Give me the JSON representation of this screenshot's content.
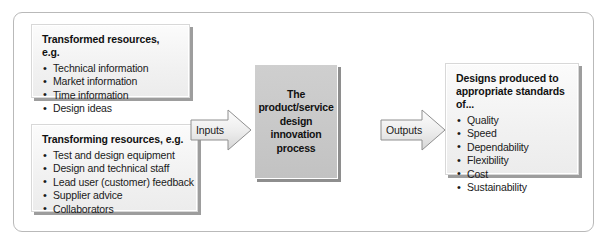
{
  "diagram": {
    "frame": {
      "border_color": "#b9b9b9",
      "background": "#ffffff"
    }
  },
  "boxes": {
    "transformed_resources": {
      "title": "Transformed resources, e.g.",
      "items": [
        "Technical information",
        "Market information",
        "Time information",
        "Design ideas"
      ]
    },
    "transforming_resources": {
      "title": "Transforming resources, e.g.",
      "items": [
        "Test and design equipment",
        "Design and technical staff",
        "Lead user (customer) feedback",
        "Supplier advice",
        "Collaborators"
      ]
    },
    "outputs_box": {
      "title": "Designs produced to appropriate standards of...",
      "items": [
        "Quality",
        "Speed",
        "Dependability",
        "Flexibility",
        "Cost",
        "Sustainability"
      ]
    }
  },
  "process": {
    "label": "The product/service design innovation process",
    "fill_color": "#c9c9c9"
  },
  "arrows": {
    "inputs": {
      "label": "Inputs",
      "icon": "chevron-right-arrow"
    },
    "outputs": {
      "label": "Outputs",
      "icon": "chevron-right-arrow"
    }
  }
}
